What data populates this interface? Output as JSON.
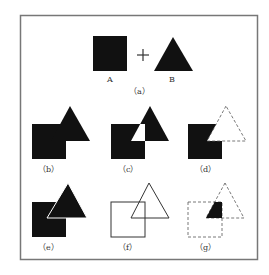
{
  "figure": {
    "panel_a": {
      "label": "（a）",
      "shape_a_label": "A",
      "shape_b_label": "B",
      "operator": "+"
    },
    "panels": [
      {
        "id": "b",
        "label": "（b）",
        "operation": "union"
      },
      {
        "id": "c",
        "label": "（c）",
        "operation": "exclusive-or"
      },
      {
        "id": "d",
        "label": "（d）",
        "operation": "subtract"
      },
      {
        "id": "e",
        "label": "（e）",
        "operation": "front-overlay"
      },
      {
        "id": "f",
        "label": "（f）",
        "operation": "outline"
      },
      {
        "id": "g",
        "label": "（g）",
        "operation": "intersect"
      }
    ],
    "colors": {
      "fill": "#111111",
      "stroke": "#333333",
      "frame": "#777777",
      "background": "#ffffff"
    }
  }
}
